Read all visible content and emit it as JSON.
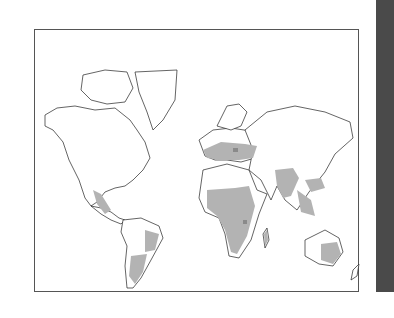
{
  "figure": {
    "type": "world-map",
    "projection": "Mercator",
    "legend": null,
    "title": null,
    "colors": {
      "background": "#ffffff",
      "coastline": "#222222",
      "shaded_region": "#b3b3b3",
      "dark_region": "#8a8a8a",
      "side_strip": "#4a4a4a"
    },
    "shaded_regions": [
      "Europe",
      "Mediterranean",
      "Sub-Saharan Africa",
      "Madagascar",
      "Indian subcontinent",
      "Southeast Asia",
      "Southern China",
      "Central Mexico",
      "Central America",
      "Eastern South America",
      "Southern South America",
      "Australia"
    ]
  }
}
